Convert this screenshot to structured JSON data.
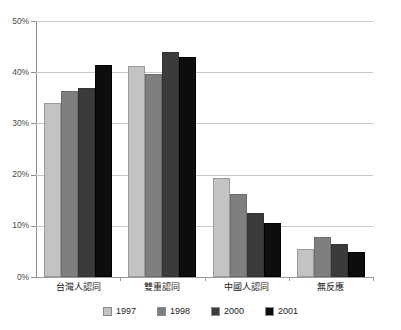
{
  "chart_data": {
    "type": "bar",
    "title": "",
    "subtitle": "",
    "xlabel": "",
    "ylabel": "",
    "ylim": [
      0,
      50
    ],
    "ytick_labels": [
      "50%",
      "40%",
      "30%",
      "20%",
      "10%",
      "0%"
    ],
    "ytick_values": [
      50,
      40,
      30,
      20,
      10,
      0
    ],
    "grid": "horizontal",
    "legend_position": "bottom-center",
    "categories": [
      "台灣人認同",
      "雙重認同",
      "中國人認同",
      "無反應"
    ],
    "series": [
      {
        "name": "1997",
        "color": "#c3c3c3",
        "values": [
          34.0,
          41.3,
          19.3,
          5.4
        ]
      },
      {
        "name": "1998",
        "color": "#7f7f7f",
        "values": [
          36.4,
          39.6,
          16.3,
          7.9
        ]
      },
      {
        "name": "2000",
        "color": "#3b3b3b",
        "values": [
          36.9,
          44.0,
          12.5,
          6.5
        ]
      },
      {
        "name": "2001",
        "color": "#0d0d0d",
        "values": [
          41.4,
          42.9,
          10.6,
          4.8
        ]
      }
    ],
    "axis_color": "#8d8d8d",
    "grid_color": "#c9c9c9",
    "background": "#ffffff"
  }
}
